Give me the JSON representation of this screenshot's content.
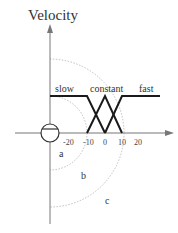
{
  "diagram": {
    "axis_title": "Velocity",
    "fuzzy_sets": [
      {
        "label": "slow"
      },
      {
        "label": "constant"
      },
      {
        "label": "fast"
      }
    ],
    "ticks": [
      "-20",
      "-10",
      "0",
      "10",
      "20"
    ],
    "regions": [
      "a",
      "b",
      "c"
    ],
    "colors": {
      "membership_line": "#1a1a1a",
      "axis": "#777777",
      "arc": "#aaaaaa"
    }
  }
}
